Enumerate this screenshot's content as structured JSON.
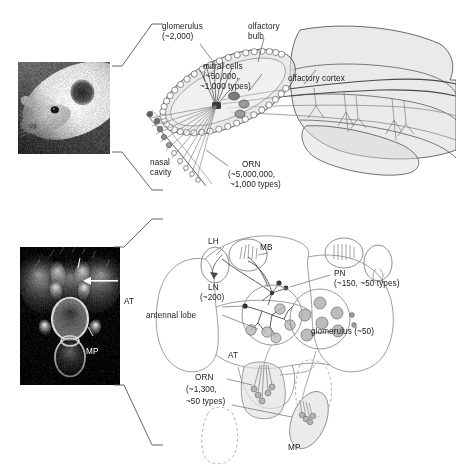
{
  "figure": {
    "background_color": "#ffffff",
    "width": 456,
    "height": 464,
    "line_color": "#4d4d4d",
    "text_color": "#1a1a1a"
  },
  "panels": [
    {
      "id": "mouse",
      "organism": "mouse",
      "photo": {
        "name": "mouse-head-photo",
        "alt_text": "mouse head photograph"
      }
    },
    {
      "id": "fly",
      "organism": "drosophila",
      "photo": {
        "name": "fly-head-photo",
        "alt_text": "fly head scanning electron micrograph"
      }
    }
  ],
  "mouse_panel": {
    "labels": {
      "glomerulus": "glomerulus",
      "glomerulus_count": "(~2,000)",
      "olfactory_bulb_line1": "olfactory",
      "olfactory_bulb_line2": "bulb",
      "mitral_cells": "mitral cells",
      "mitral_cells_count1": "(~50,000,",
      "mitral_cells_count2": "~1,000 types)",
      "olfactory_cortex": "olfactory cortex",
      "nasal_cavity_line1": "nasal",
      "nasal_cavity_line2": "cavity",
      "orn": "ORN",
      "orn_count1": "(~5,000,000,",
      "orn_count2": "~1,000 types)"
    }
  },
  "fly_panel": {
    "photo_labels": {
      "at": "AT",
      "mp": "MP"
    },
    "labels": {
      "lh": "LH",
      "mb": "MB",
      "pn": "PN",
      "pn_count": "(~150, ~50 types)",
      "ln": "LN",
      "ln_count": "(~200)",
      "antennal_lobe": "antennal lobe",
      "glomerulus": "glomerulus (~50)",
      "at": "AT",
      "orn": "ORN",
      "orn_count1": "(~1,300,",
      "orn_count2": "~50 types)",
      "mp": "MP"
    }
  },
  "chart_data": {
    "type": "diagram",
    "systems": [
      {
        "organism": "mouse",
        "elements": [
          {
            "name": "ORN",
            "full_name": "olfactory receptor neuron",
            "count": "~5,000,000",
            "types": "~1,000 types",
            "location": "nasal cavity"
          },
          {
            "name": "glomerulus",
            "count": "~2,000",
            "location": "olfactory bulb"
          },
          {
            "name": "mitral cells",
            "count": "~50,000",
            "types": "~1,000 types",
            "location": "olfactory bulb"
          },
          {
            "name": "olfactory cortex",
            "count": "",
            "types": "",
            "location": "brain"
          }
        ]
      },
      {
        "organism": "drosophila",
        "elements": [
          {
            "name": "ORN",
            "full_name": "olfactory receptor neuron",
            "count": "~1,300",
            "types": "~50 types",
            "location": "AT / MP"
          },
          {
            "name": "glomerulus",
            "count": "~50",
            "location": "antennal lobe"
          },
          {
            "name": "PN",
            "full_name": "projection neuron",
            "count": "~150",
            "types": "~50 types",
            "location": "antennal lobe"
          },
          {
            "name": "LN",
            "full_name": "local neuron",
            "count": "~200",
            "location": "antennal lobe"
          },
          {
            "name": "MB",
            "full_name": "mushroom body",
            "location": "brain"
          },
          {
            "name": "LH",
            "full_name": "lateral horn",
            "location": "brain"
          },
          {
            "name": "AT",
            "full_name": "antenna",
            "location": "head"
          },
          {
            "name": "MP",
            "full_name": "maxillary palp",
            "location": "head"
          }
        ]
      }
    ]
  }
}
